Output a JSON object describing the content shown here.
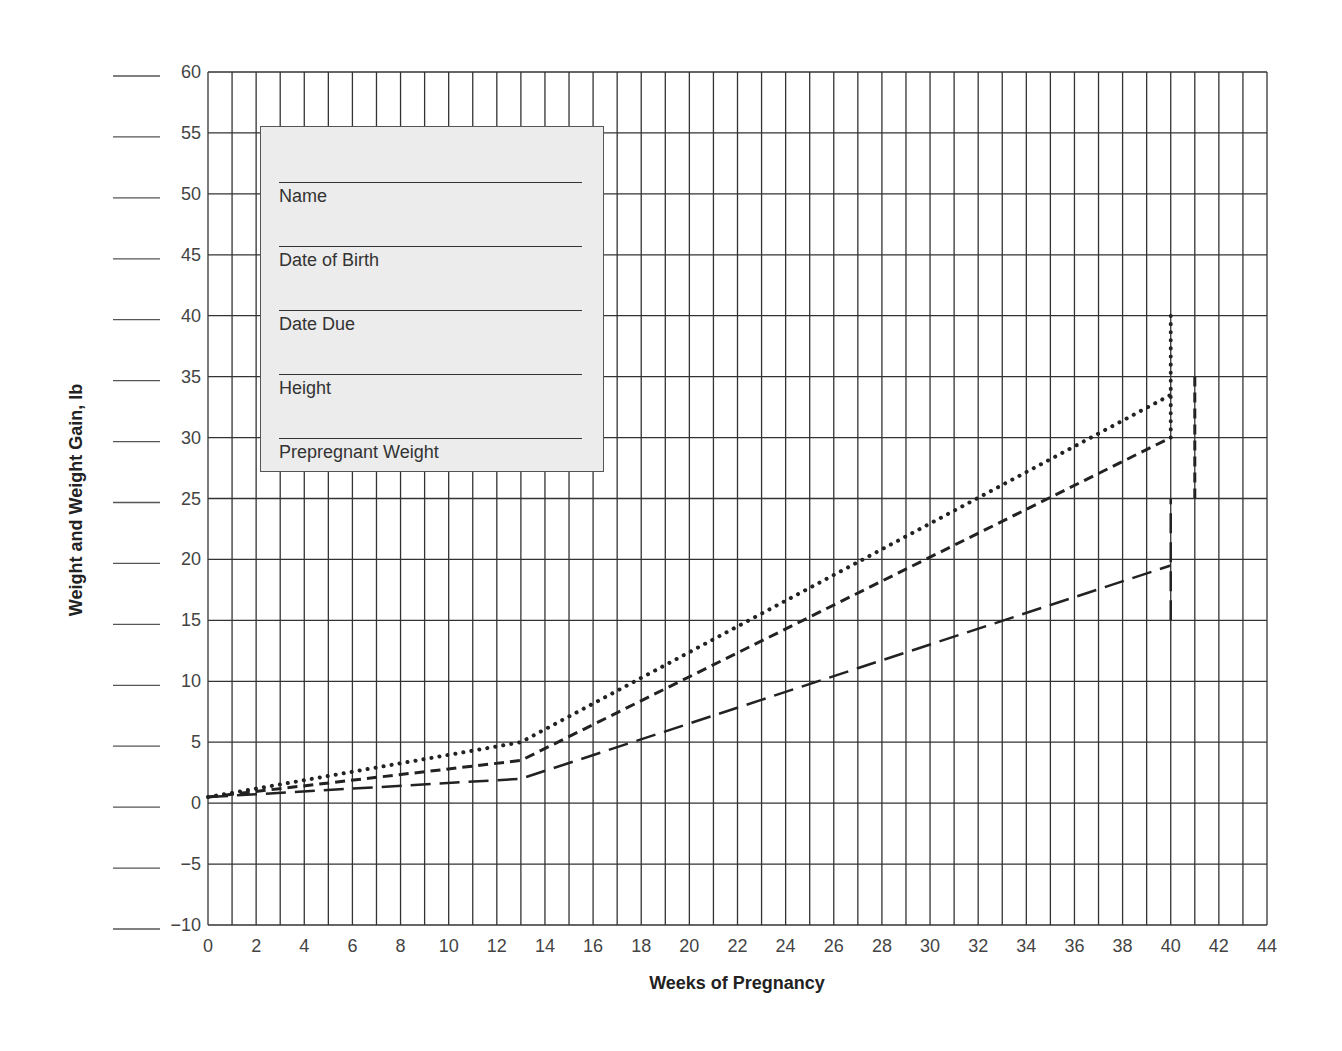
{
  "chart_data": {
    "type": "line",
    "title": "",
    "xlabel": "Weeks of Pregnancy",
    "ylabel": "Weight and Weight Gain, lb",
    "xlim": [
      0,
      44
    ],
    "ylim": [
      -10,
      60
    ],
    "x_ticks": [
      0,
      2,
      4,
      6,
      8,
      10,
      12,
      14,
      16,
      18,
      20,
      22,
      24,
      26,
      28,
      30,
      32,
      34,
      36,
      38,
      40,
      42,
      44
    ],
    "y_ticks": [
      60,
      55,
      50,
      45,
      40,
      35,
      30,
      25,
      20,
      15,
      10,
      5,
      0,
      -5,
      -10
    ],
    "grid": true,
    "grid_x_step": 1,
    "grid_y_step": 5,
    "legend": null,
    "series": [
      {
        "name": "dotted",
        "style": "dotted",
        "x": [
          0,
          13,
          40
        ],
        "values": [
          0.5,
          5,
          33.5
        ],
        "range_bar": {
          "x": 40,
          "y_min": 30,
          "y_max": 40
        }
      },
      {
        "name": "short-dashed",
        "style": "short-dash",
        "x": [
          0,
          13,
          40
        ],
        "values": [
          0.5,
          3.5,
          30
        ],
        "range_bar": {
          "x": 41,
          "y_min": 25,
          "y_max": 35
        }
      },
      {
        "name": "long-dashed",
        "style": "long-dash",
        "x": [
          0,
          13,
          40
        ],
        "values": [
          0.5,
          2,
          19.5
        ],
        "range_bar": {
          "x": 40,
          "y_min": 15,
          "y_max": 25
        }
      }
    ]
  },
  "form": {
    "fields": [
      {
        "label": "Name"
      },
      {
        "label": "Date of Birth"
      },
      {
        "label": "Date Due"
      },
      {
        "label": "Height"
      },
      {
        "label": "Prepregnant Weight"
      }
    ]
  },
  "colors": {
    "grid": "#333333",
    "line": "#222222",
    "form_fill": "#ececec"
  }
}
